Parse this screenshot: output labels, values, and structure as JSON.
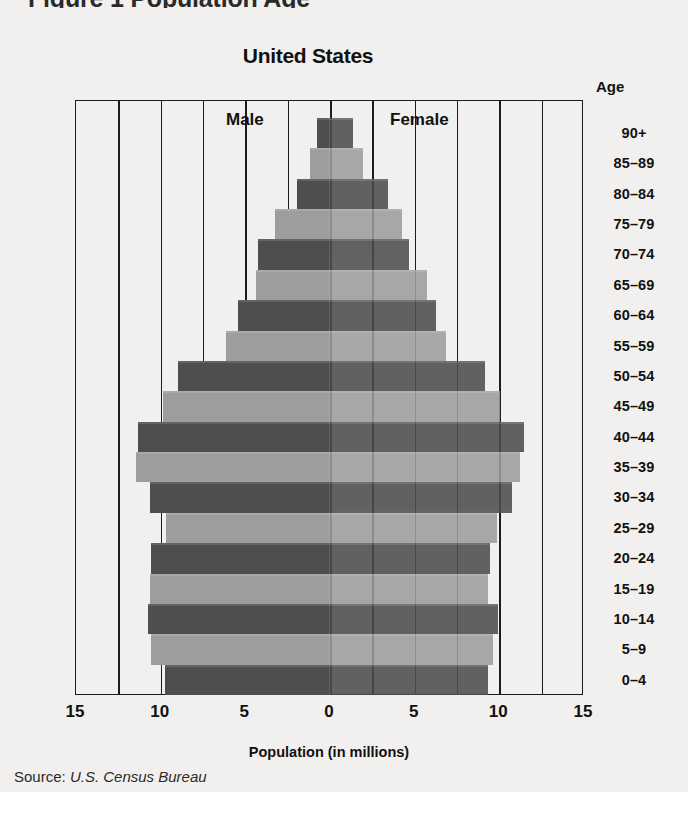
{
  "page": {
    "clipped_header": "Figure 1   Population Age",
    "source_label": "Source:",
    "source_value": "U.S. Census Bureau",
    "age_header": "Age",
    "label_male": "Male",
    "label_female": "Female"
  },
  "colors": {
    "bar_dark": "#4e4e4e",
    "bar_light": "#9d9d9d",
    "axis": "#1c1c1c",
    "page_bg": "#f1f0ee",
    "text": "#111111"
  },
  "chart_data": {
    "type": "bar",
    "subtype": "population-pyramid",
    "title": "United States",
    "xlabel": "Population (in millions)",
    "ylabel": "Age",
    "grid": true,
    "legend_position": "inside-top",
    "xlim": [
      -15,
      15
    ],
    "xticks": [
      15,
      10,
      5,
      0,
      5,
      10,
      15
    ],
    "xtick_values": [
      -15,
      -10,
      -5,
      0,
      5,
      10,
      15
    ],
    "gridline_values": [
      -15,
      -12.5,
      -10,
      -7.5,
      -5,
      -2.5,
      0,
      2.5,
      5,
      7.5,
      10,
      12.5,
      15
    ],
    "categories": [
      "90+",
      "85–89",
      "80–84",
      "75–79",
      "70–74",
      "65–69",
      "60–64",
      "55–59",
      "50–54",
      "45–49",
      "40–44",
      "35–39",
      "30–34",
      "25–29",
      "20–24",
      "15–19",
      "10–14",
      "5–9",
      "0–4"
    ],
    "series": [
      {
        "name": "Male",
        "side": "left",
        "values": [
          0.7,
          1.1,
          1.9,
          3.2,
          4.2,
          4.3,
          5.4,
          6.1,
          8.9,
          9.8,
          11.3,
          11.4,
          10.6,
          9.6,
          10.5,
          10.6,
          10.7,
          10.5,
          9.7
        ]
      },
      {
        "name": "Female",
        "side": "right",
        "values": [
          1.4,
          2.0,
          3.5,
          4.3,
          4.7,
          5.8,
          6.3,
          6.9,
          9.2,
          10.1,
          11.5,
          11.3,
          10.8,
          9.9,
          9.5,
          9.4,
          10.0,
          9.7,
          9.4
        ]
      }
    ],
    "bar_shades": [
      "dark",
      "light",
      "dark",
      "light",
      "dark",
      "light",
      "dark",
      "light",
      "dark",
      "light",
      "dark",
      "light",
      "dark",
      "light",
      "dark",
      "light",
      "dark",
      "light",
      "dark"
    ]
  }
}
